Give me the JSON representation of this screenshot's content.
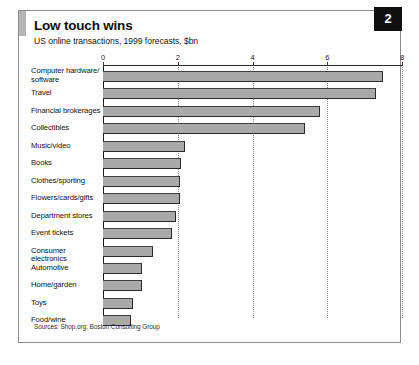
{
  "figure": {
    "page_number": "2",
    "title": "Low touch wins",
    "subtitle": "US online transactions, 1999 forecasts, $bn",
    "source_note": "Sources: Shop.org; Boston Consulting Group",
    "bar_color": "#a9a9a9",
    "badge_color": "#101010",
    "accent_color": "#b5b5b5"
  },
  "chart_data": {
    "type": "bar",
    "orientation": "horizontal",
    "title": "Low touch wins",
    "subtitle": "US online transactions, 1999 forecasts, $bn",
    "xlabel": "",
    "ylabel": "",
    "xlim": [
      0,
      8
    ],
    "xticks": [
      0,
      2,
      4,
      6,
      8
    ],
    "xtick_labels": [
      "0",
      "2",
      "4",
      "6",
      "8"
    ],
    "grid": "vertical-dotted",
    "legend": "none",
    "units": "$bn",
    "source": "Sources: Shop.org; Boston Consulting Group",
    "categories": [
      "Computer hardware/ software",
      "Travel",
      "Financial brokerages",
      "Collectibles",
      "Music/video",
      "Books",
      "Clothes/sporting",
      "Flowers/cards/gifts",
      "Department stores",
      "Event tickets",
      "Consumer electronics",
      "Automotive",
      "Home/garden",
      "Toys",
      "Food/wine"
    ],
    "values": [
      7.5,
      7.3,
      5.8,
      5.4,
      2.2,
      2.1,
      2.05,
      2.05,
      1.95,
      1.85,
      1.35,
      1.05,
      1.05,
      0.8,
      0.75
    ]
  }
}
